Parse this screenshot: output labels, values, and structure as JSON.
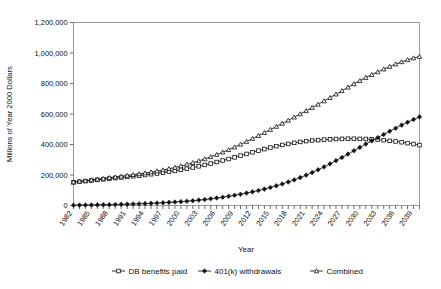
{
  "chart_data": {
    "type": "line",
    "title": "",
    "xlabel": "Year",
    "ylabel": "Millions of Year 2000 Dollars",
    "ylim": [
      0,
      1200000
    ],
    "ytick_labels": [
      "0",
      "200,000",
      "400,000",
      "600,000",
      "800,000",
      "1,000,000",
      "1,200,000"
    ],
    "ytick_values": [
      0,
      200000,
      400000,
      600000,
      800000,
      1000000,
      1200000
    ],
    "xlim": [
      1982,
      2040
    ],
    "xtick_labels": [
      "1982",
      "1985",
      "1988",
      "1991",
      "1994",
      "1997",
      "2000",
      "2003",
      "2006",
      "2009",
      "2012",
      "2015",
      "2018",
      "2021",
      "2024",
      "2027",
      "2030",
      "2033",
      "2036",
      "2039"
    ],
    "grid": false,
    "legend_position": "bottom",
    "x": [
      1982,
      1983,
      1984,
      1985,
      1986,
      1987,
      1988,
      1989,
      1990,
      1991,
      1992,
      1993,
      1994,
      1995,
      1996,
      1997,
      1998,
      1999,
      2000,
      2001,
      2002,
      2003,
      2004,
      2005,
      2006,
      2007,
      2008,
      2009,
      2010,
      2011,
      2012,
      2013,
      2014,
      2015,
      2016,
      2017,
      2018,
      2019,
      2020,
      2021,
      2022,
      2023,
      2024,
      2025,
      2026,
      2027,
      2028,
      2029,
      2030,
      2031,
      2032,
      2033,
      2034,
      2035,
      2036,
      2037,
      2038,
      2039,
      2040
    ],
    "series": [
      {
        "name": "DB benefits paid",
        "marker": "open-square",
        "values": [
          152000,
          156000,
          160000,
          164000,
          168000,
          172000,
          176000,
          180000,
          184000,
          188000,
          192000,
          196000,
          200000,
          205000,
          210000,
          215000,
          221000,
          227000,
          234000,
          241000,
          249000,
          257000,
          266000,
          275000,
          285000,
          295000,
          305000,
          316000,
          327000,
          338000,
          349000,
          360000,
          370000,
          380000,
          389000,
          397000,
          404000,
          411000,
          417000,
          422000,
          426000,
          429000,
          432000,
          434000,
          436000,
          437000,
          438000,
          438000,
          437000,
          436000,
          434000,
          431000,
          428000,
          424000,
          420000,
          415000,
          409000,
          403000,
          396000
        ]
      },
      {
        "name": "401(k) withdrawals",
        "marker": "filled-diamond",
        "values": [
          2000,
          2500,
          3000,
          3500,
          4200,
          4900,
          5700,
          6600,
          7600,
          8700,
          9900,
          11200,
          12600,
          14200,
          16000,
          18000,
          20200,
          22600,
          25300,
          28300,
          31600,
          35300,
          39400,
          44000,
          49000,
          54500,
          60500,
          67000,
          74000,
          81500,
          89500,
          98000,
          107500,
          118000,
          129000,
          141000,
          154000,
          168000,
          183000,
          199000,
          216000,
          234000,
          253000,
          273000,
          294000,
          315000,
          337000,
          359000,
          381000,
          403000,
          424000,
          445000,
          466000,
          487000,
          507000,
          527000,
          546000,
          564000,
          581000
        ]
      },
      {
        "name": "Combined",
        "marker": "open-triangle",
        "values": [
          154000,
          158500,
          163000,
          167500,
          172200,
          176900,
          181700,
          186600,
          191600,
          196700,
          201900,
          207200,
          212600,
          219200,
          226000,
          233000,
          241200,
          249600,
          259300,
          269300,
          280600,
          292300,
          305400,
          319000,
          334000,
          349500,
          365500,
          383000,
          401000,
          419500,
          438500,
          458000,
          477500,
          498000,
          518000,
          538000,
          558000,
          579000,
          600000,
          621000,
          642000,
          663000,
          685000,
          707000,
          730000,
          752000,
          775000,
          797000,
          818000,
          839000,
          858000,
          876000,
          894000,
          911000,
          927000,
          942000,
          955000,
          967000,
          977000
        ]
      }
    ]
  },
  "legend": {
    "items": [
      {
        "label": "DB benefits paid",
        "marker": "open-square"
      },
      {
        "label": "401(k) withdrawals",
        "marker": "filled-diamond"
      },
      {
        "label": "Combined",
        "marker": "open-triangle"
      }
    ]
  }
}
